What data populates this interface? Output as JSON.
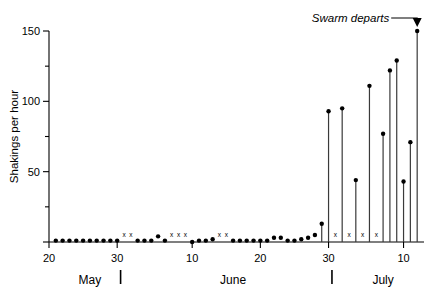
{
  "chart_data": {
    "type": "bar",
    "title": "",
    "xlabel": "",
    "ylabel": "Shakings per hour",
    "ylim": [
      0,
      155
    ],
    "xlim": [
      20,
      75
    ],
    "grid": false,
    "legend": null,
    "y_ticks_major": [
      0,
      50,
      100,
      150
    ],
    "y_ticks_major_labels": [
      "",
      "50",
      "100",
      "150"
    ],
    "y_ticks_minor": [
      25,
      75,
      125
    ],
    "x_ticks_major": [
      20,
      30,
      41,
      51,
      61,
      72
    ],
    "x_ticks_major_labels": [
      "20",
      "30",
      "10",
      "20",
      "30",
      "10"
    ],
    "x_month_labels": [
      "May",
      "June",
      "July"
    ],
    "x_month_separators": [
      30.5,
      61.5
    ],
    "annotation": {
      "text": "Swarm departs",
      "points_to_day": 74,
      "points_to_value": 150
    },
    "missing_marker": "x",
    "missing_label": "x",
    "series": [
      {
        "name": "Shakings per hour",
        "points": [
          {
            "day": 21,
            "value": 1
          },
          {
            "day": 22,
            "value": 1
          },
          {
            "day": 23,
            "value": 1
          },
          {
            "day": 24,
            "value": 1
          },
          {
            "day": 25,
            "value": 1
          },
          {
            "day": 26,
            "value": 1
          },
          {
            "day": 27,
            "value": 1
          },
          {
            "day": 28,
            "value": 1
          },
          {
            "day": 29,
            "value": 1
          },
          {
            "day": 30,
            "value": 1
          },
          {
            "day": 31,
            "value": null
          },
          {
            "day": 32,
            "value": null
          },
          {
            "day": 33,
            "value": 1
          },
          {
            "day": 34,
            "value": 1
          },
          {
            "day": 35,
            "value": 1
          },
          {
            "day": 36,
            "value": 4
          },
          {
            "day": 37,
            "value": 1
          },
          {
            "day": 38,
            "value": null
          },
          {
            "day": 39,
            "value": null
          },
          {
            "day": 40,
            "value": null
          },
          {
            "day": 41,
            "value": 0
          },
          {
            "day": 42,
            "value": 1
          },
          {
            "day": 43,
            "value": 1
          },
          {
            "day": 44,
            "value": 2
          },
          {
            "day": 45,
            "value": null
          },
          {
            "day": 46,
            "value": null
          },
          {
            "day": 47,
            "value": 1
          },
          {
            "day": 48,
            "value": 1
          },
          {
            "day": 49,
            "value": 1
          },
          {
            "day": 50,
            "value": 1
          },
          {
            "day": 51,
            "value": 1
          },
          {
            "day": 52,
            "value": 1
          },
          {
            "day": 53,
            "value": 3
          },
          {
            "day": 54,
            "value": 3
          },
          {
            "day": 55,
            "value": 1
          },
          {
            "day": 56,
            "value": 1
          },
          {
            "day": 57,
            "value": 2
          },
          {
            "day": 58,
            "value": 3
          },
          {
            "day": 59,
            "value": 5
          },
          {
            "day": 60,
            "value": 13
          },
          {
            "day": 61,
            "value": 93
          },
          {
            "day": 62,
            "value": null
          },
          {
            "day": 63,
            "value": 95
          },
          {
            "day": 64,
            "value": null
          },
          {
            "day": 65,
            "value": 44
          },
          {
            "day": 66,
            "value": null
          },
          {
            "day": 67,
            "value": 111
          },
          {
            "day": 68,
            "value": null
          },
          {
            "day": 69,
            "value": 77
          },
          {
            "day": 70,
            "value": 122
          },
          {
            "day": 71,
            "value": 129
          },
          {
            "day": 72,
            "value": 43
          },
          {
            "day": 73,
            "value": 71
          },
          {
            "day": 74,
            "value": 150
          }
        ]
      }
    ]
  }
}
